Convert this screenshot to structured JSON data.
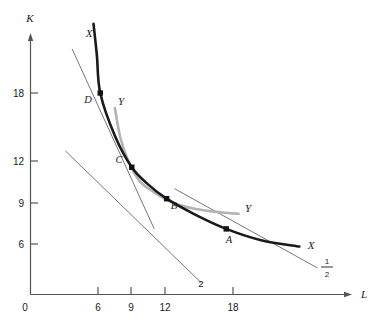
{
  "chart_data": {
    "type": "line",
    "title": "",
    "xlabel": "L",
    "ylabel": "K",
    "xlim": [
      0,
      30
    ],
    "ylim": [
      0,
      24
    ],
    "grid": false,
    "legend": "none",
    "origin_label": "0",
    "x_ticks": [
      {
        "value": 6,
        "label": "6"
      },
      {
        "value": 9,
        "label": "9"
      },
      {
        "value": 12,
        "label": "12"
      },
      {
        "value": 18,
        "label": "18"
      }
    ],
    "y_ticks": [
      {
        "value": 6,
        "label": "6"
      },
      {
        "value": 9,
        "label": "9"
      },
      {
        "value": 12,
        "label": "12"
      },
      {
        "value": 18,
        "label": "18"
      }
    ],
    "series": [
      {
        "name": "X",
        "description": "isoquant X (dark, thick)",
        "color": "#1a1a1a",
        "label_start": "X",
        "label_end": "X",
        "points": [
          {
            "L": 5.6,
            "K": 23.5
          },
          {
            "L": 5.9,
            "K": 21.0
          },
          {
            "L": 6.2,
            "K": 18.0
          },
          {
            "L": 7.5,
            "K": 14.6
          },
          {
            "L": 9.0,
            "K": 12.1
          },
          {
            "L": 10.5,
            "K": 10.7
          },
          {
            "L": 12.1,
            "K": 9.6
          },
          {
            "L": 14.5,
            "K": 8.4
          },
          {
            "L": 17.4,
            "K": 7.2
          },
          {
            "L": 20.5,
            "K": 6.3
          },
          {
            "L": 23.9,
            "K": 5.8
          }
        ]
      },
      {
        "name": "Y",
        "description": "isoquant Y (light gray)",
        "color": "#b3b3b3",
        "label_start": "Y",
        "label_end": "Y",
        "points": [
          {
            "L": 7.5,
            "K": 16.8
          },
          {
            "L": 8.0,
            "K": 14.4
          },
          {
            "L": 8.7,
            "K": 12.6
          },
          {
            "L": 9.7,
            "K": 11.0
          },
          {
            "L": 11.0,
            "K": 10.1
          },
          {
            "L": 12.6,
            "K": 9.3
          },
          {
            "L": 14.6,
            "K": 8.8
          },
          {
            "L": 17.0,
            "K": 8.5
          },
          {
            "L": 18.5,
            "K": 8.4
          }
        ]
      }
    ],
    "tangent_lines": [
      {
        "name": "tangent-at-D",
        "slope_label": "",
        "from": {
          "L": 3.7,
          "K": 21.5
        },
        "to": {
          "L": 11.0,
          "K": 7.2
        }
      },
      {
        "name": "tangent-at-C",
        "slope_label": "2",
        "from": {
          "L": 3.1,
          "K": 13.4
        },
        "to": {
          "L": 15.2,
          "K": 2.9
        }
      },
      {
        "name": "tangent-at-A",
        "slope_label": "1/2",
        "slope_numerator": "1",
        "slope_denominator": "2",
        "from": {
          "L": 12.8,
          "K": 10.4
        },
        "to": {
          "L": 25.5,
          "K": 4.1
        }
      }
    ],
    "points": [
      {
        "name": "D",
        "label": "D",
        "L": 6.2,
        "K": 18.0
      },
      {
        "name": "C",
        "label": "C",
        "L": 9.0,
        "K": 12.1
      },
      {
        "name": "B",
        "label": "B",
        "L": 12.1,
        "K": 9.6
      },
      {
        "name": "A",
        "label": "A",
        "L": 17.4,
        "K": 7.2
      }
    ]
  }
}
